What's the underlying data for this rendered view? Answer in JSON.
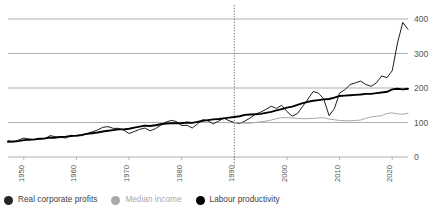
{
  "chart_data": {
    "type": "line",
    "title": "",
    "subtitle": "",
    "xlabel": "",
    "ylabel": "",
    "xlim": [
      1947,
      2023
    ],
    "ylim": [
      0,
      415
    ],
    "grid": true,
    "gridlines_y": [
      0,
      100,
      200,
      300,
      400
    ],
    "legend_position": "bottom-left",
    "index_base_note": "1990 = 100",
    "annotations": [
      {
        "type": "vertical-dashed-line",
        "x": 1990,
        "label": ""
      }
    ],
    "yticks": [
      "0",
      "100",
      "200",
      "300",
      "400"
    ],
    "xticks": [
      "1950",
      "1960",
      "1970",
      "1980",
      "1990",
      "2000",
      "2010",
      "2020"
    ],
    "series": [
      {
        "name": "Real corporate profits",
        "color": "#1d1d1b",
        "x": [
          1947,
          1948,
          1949,
          1950,
          1951,
          1952,
          1953,
          1954,
          1955,
          1956,
          1957,
          1958,
          1959,
          1960,
          1961,
          1962,
          1963,
          1964,
          1965,
          1966,
          1967,
          1968,
          1969,
          1970,
          1971,
          1972,
          1973,
          1974,
          1975,
          1976,
          1977,
          1978,
          1979,
          1980,
          1981,
          1982,
          1983,
          1984,
          1985,
          1986,
          1987,
          1988,
          1989,
          1990,
          1991,
          1992,
          1993,
          1994,
          1995,
          1996,
          1997,
          1998,
          1999,
          2000,
          2001,
          2002,
          2003,
          2004,
          2005,
          2006,
          2007,
          2008,
          2009,
          2010,
          2011,
          2012,
          2013,
          2014,
          2015,
          2016,
          2017,
          2018,
          2019,
          2020,
          2021,
          2022,
          2023
        ],
        "values": [
          47,
          44,
          49,
          55,
          52,
          50,
          52,
          53,
          62,
          59,
          57,
          55,
          63,
          61,
          62,
          68,
          73,
          78,
          86,
          88,
          83,
          83,
          78,
          68,
          74,
          80,
          84,
          76,
          82,
          92,
          101,
          106,
          103,
          91,
          92,
          84,
          96,
          108,
          105,
          96,
          104,
          113,
          105,
          100,
          97,
          104,
          113,
          124,
          130,
          138,
          147,
          141,
          150,
          132,
          118,
          126,
          147,
          168,
          190,
          185,
          168,
          120,
          140,
          185,
          195,
          210,
          215,
          220,
          210,
          205,
          215,
          235,
          230,
          250,
          330,
          390,
          370
        ]
      },
      {
        "name": "Median income",
        "color": "#a8a8a8",
        "x": [
          1990,
          1991,
          1992,
          1993,
          1994,
          1995,
          1996,
          1997,
          1998,
          1999,
          2000,
          2001,
          2002,
          2003,
          2004,
          2005,
          2006,
          2007,
          2008,
          2009,
          2010,
          2011,
          2012,
          2013,
          2014,
          2015,
          2016,
          2017,
          2018,
          2019,
          2020,
          2021,
          2022,
          2023
        ],
        "values": [
          100,
          99,
          98,
          98,
          100,
          102,
          104,
          107,
          111,
          114,
          114,
          113,
          112,
          111,
          111,
          112,
          113,
          114,
          110,
          108,
          106,
          105,
          105,
          106,
          107,
          112,
          116,
          118,
          120,
          126,
          128,
          125,
          124,
          127
        ]
      },
      {
        "name": "Labour productivity",
        "color": "#000000",
        "x": [
          1947,
          1948,
          1949,
          1950,
          1951,
          1952,
          1953,
          1954,
          1955,
          1956,
          1957,
          1958,
          1959,
          1960,
          1961,
          1962,
          1963,
          1964,
          1965,
          1966,
          1967,
          1968,
          1969,
          1970,
          1971,
          1972,
          1973,
          1974,
          1975,
          1976,
          1977,
          1978,
          1979,
          1980,
          1981,
          1982,
          1983,
          1984,
          1985,
          1986,
          1987,
          1988,
          1989,
          1990,
          1991,
          1992,
          1993,
          1994,
          1995,
          1996,
          1997,
          1998,
          1999,
          2000,
          2001,
          2002,
          2003,
          2004,
          2005,
          2006,
          2007,
          2008,
          2009,
          2010,
          2011,
          2012,
          2013,
          2014,
          2015,
          2016,
          2017,
          2018,
          2019,
          2020,
          2021,
          2022,
          2023
        ],
        "values": [
          44,
          45,
          46,
          49,
          50,
          51,
          53,
          54,
          56,
          56,
          58,
          59,
          61,
          62,
          64,
          67,
          69,
          71,
          74,
          76,
          78,
          80,
          80,
          82,
          85,
          88,
          91,
          90,
          92,
          95,
          97,
          98,
          98,
          98,
          100,
          99,
          102,
          105,
          107,
          109,
          110,
          112,
          114,
          116,
          118,
          122,
          123,
          124,
          125,
          128,
          131,
          135,
          139,
          143,
          146,
          151,
          156,
          160,
          163,
          165,
          167,
          168,
          172,
          177,
          178,
          179,
          180,
          181,
          183,
          183,
          185,
          187,
          189,
          196,
          198,
          196,
          198
        ]
      }
    ]
  },
  "legend": {
    "items": [
      {
        "label": "Real corporate profits",
        "color": "#262626",
        "text_color": "#3c3c3c"
      },
      {
        "label": "Median income",
        "color": "#a8a8a8",
        "text_color": "#a8a8a8"
      },
      {
        "label": "Labour productivity",
        "color": "#000000",
        "text_color": "#3c3c3c"
      }
    ]
  },
  "axis": {
    "y_labels": [
      "400",
      "300",
      "200",
      "100",
      "0"
    ],
    "x_labels": [
      "1950",
      "1960",
      "1970",
      "1980",
      "1990",
      "2000",
      "2010",
      "2020"
    ]
  },
  "colors": {
    "gridline": "#9a9a9a",
    "background": "#ffffff",
    "dashed_marker": "#4a4a4a",
    "tick_text": "#555555"
  }
}
